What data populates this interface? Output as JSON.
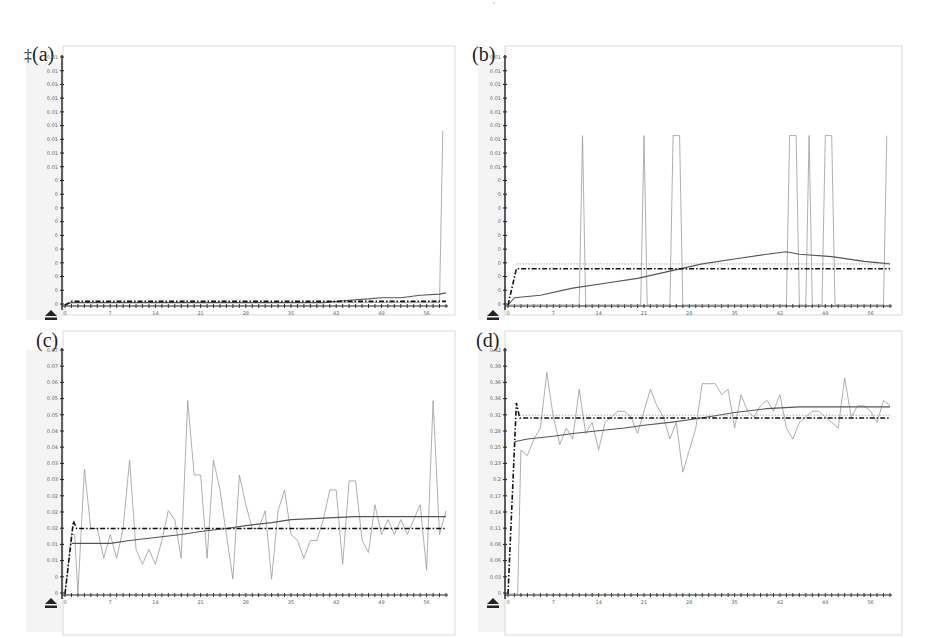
{
  "figure": {
    "top_mark": "'",
    "panels": [
      {
        "id": "a",
        "label": "(a)",
        "prefix_glyph": "‡"
      },
      {
        "id": "b",
        "label": "(b)"
      },
      {
        "id": "c",
        "label": "(c)"
      },
      {
        "id": "d",
        "label": "(d)"
      }
    ]
  },
  "chart_data": [
    {
      "panel": "(a)",
      "type": "line",
      "title": "",
      "xlabel": "",
      "ylabel": "",
      "x_ticks": [
        "0",
        "7",
        "14",
        "21",
        "28",
        "35",
        "42",
        "49",
        "56"
      ],
      "y_ticks": [
        "0",
        "0",
        "0",
        "0",
        "0",
        "0",
        "0",
        "0",
        "0",
        "0",
        "0.01",
        "0.01",
        "0.01",
        "0.01",
        "0.01",
        "0.01",
        "0.01",
        "0.01",
        "0.01"
      ],
      "xlim": [
        0,
        59
      ],
      "ylim": [
        0,
        1
      ],
      "series": [
        {
          "name": "observed",
          "style": "thin-gray",
          "x": [
            0,
            1,
            58,
            58.5
          ],
          "y": [
            0,
            0.01,
            0.01,
            0.72
          ]
        },
        {
          "name": "moving-average",
          "style": "solid-dark",
          "x": [
            0,
            1,
            40,
            44,
            47,
            49,
            52,
            55,
            58,
            59
          ],
          "y": [
            0,
            0.01,
            0.01,
            0.02,
            0.025,
            0.03,
            0.03,
            0.04,
            0.045,
            0.05
          ]
        },
        {
          "name": "baseline",
          "style": "dash-dot-bold",
          "x": [
            0,
            1,
            59
          ],
          "y": [
            0,
            0.015,
            0.015
          ]
        }
      ]
    },
    {
      "panel": "(b)",
      "type": "line",
      "title": "",
      "xlabel": "",
      "ylabel": "",
      "x_ticks": [
        "0",
        "7",
        "14",
        "21",
        "28",
        "35",
        "42",
        "49",
        "56"
      ],
      "y_ticks": [
        "0",
        "0",
        "0",
        "0",
        "0",
        "0",
        "0",
        "0",
        "0",
        "0",
        "0.01",
        "0.01",
        "0.01",
        "0.01",
        "0.01",
        "0.01",
        "0.01",
        "0.01",
        "0.01"
      ],
      "xlim": [
        0,
        59
      ],
      "ylim": [
        0,
        1
      ],
      "series": [
        {
          "name": "observed",
          "style": "thin-gray",
          "x": [
            0,
            1,
            11,
            11.5,
            12,
            20.5,
            21,
            21.5,
            25,
            25.5,
            26.5,
            27,
            43,
            43.5,
            44.5,
            45,
            46,
            46.5,
            47,
            48.5,
            49,
            50,
            50.5,
            58,
            58.5
          ],
          "y": [
            0,
            0,
            0,
            0.7,
            0,
            0,
            0.7,
            0,
            0,
            0.7,
            0.7,
            0,
            0,
            0.7,
            0.7,
            0,
            0,
            0.7,
            0,
            0,
            0.7,
            0.7,
            0,
            0,
            0.7
          ]
        },
        {
          "name": "moving-average",
          "style": "solid-dark",
          "x": [
            0,
            1,
            5,
            10,
            15,
            20,
            25,
            30,
            35,
            40,
            43,
            45,
            50,
            55,
            59
          ],
          "y": [
            0,
            0.03,
            0.04,
            0.07,
            0.09,
            0.11,
            0.14,
            0.17,
            0.19,
            0.21,
            0.22,
            0.21,
            0.2,
            0.18,
            0.17
          ]
        },
        {
          "name": "baseline",
          "style": "dash-dot-bold",
          "x": [
            0,
            1.3,
            59
          ],
          "y": [
            0,
            0.15,
            0.15
          ]
        },
        {
          "name": "upper-reference",
          "style": "dotted-gray",
          "x": [
            1.3,
            59
          ],
          "y": [
            0.17,
            0.17
          ]
        }
      ]
    },
    {
      "panel": "(c)",
      "type": "line",
      "title": "",
      "xlabel": "",
      "ylabel": "",
      "x_ticks": [
        "0",
        "7",
        "14",
        "21",
        "28",
        "35",
        "42",
        "49",
        "56"
      ],
      "y_ticks": [
        "0",
        "0",
        "0.01",
        "0.01",
        "0.02",
        "0.02",
        "0.02",
        "0.03",
        "0.03",
        "0.04",
        "0.04",
        "0.05",
        "0.05",
        "0.06",
        "0.07",
        "0.07"
      ],
      "xlim": [
        0,
        59
      ],
      "ylim": [
        0,
        0.08
      ],
      "series": [
        {
          "name": "observed",
          "style": "thin-gray",
          "x": [
            0,
            1,
            1.5,
            2,
            3,
            4,
            5,
            6,
            7,
            8,
            9,
            10,
            11,
            12,
            13,
            14,
            15,
            16,
            17,
            18,
            19,
            20,
            21,
            22,
            23,
            24,
            25,
            26,
            27,
            28,
            29,
            30,
            31,
            32,
            33,
            34,
            35,
            36,
            37,
            38,
            39,
            40,
            41,
            42,
            43,
            44,
            45,
            46,
            47,
            48,
            49,
            50,
            51,
            52,
            53,
            54,
            55,
            56,
            57,
            58,
            59
          ],
          "y": [
            0,
            0.02,
            0.02,
            0,
            0.042,
            0.022,
            0.022,
            0.012,
            0.02,
            0.012,
            0.022,
            0.045,
            0.015,
            0.01,
            0.015,
            0.01,
            0.018,
            0.028,
            0.025,
            0.012,
            0.065,
            0.04,
            0.04,
            0.012,
            0.045,
            0.035,
            0.02,
            0.005,
            0.04,
            0.03,
            0.022,
            0.022,
            0.028,
            0.005,
            0.028,
            0.035,
            0.02,
            0.018,
            0.012,
            0.018,
            0.018,
            0.025,
            0.035,
            0.035,
            0.01,
            0.038,
            0.038,
            0.018,
            0.014,
            0.03,
            0.02,
            0.025,
            0.02,
            0.025,
            0.02,
            0.025,
            0.03,
            0.008,
            0.065,
            0.02,
            0.028
          ]
        },
        {
          "name": "moving-average",
          "style": "solid-dark",
          "x": [
            1,
            3,
            7,
            10,
            14,
            18,
            21,
            25,
            28,
            32,
            35,
            40,
            45,
            50,
            55,
            59
          ],
          "y": [
            0.017,
            0.017,
            0.017,
            0.018,
            0.019,
            0.02,
            0.021,
            0.022,
            0.023,
            0.024,
            0.025,
            0.0255,
            0.026,
            0.026,
            0.026,
            0.026
          ]
        },
        {
          "name": "baseline",
          "style": "dash-dot-bold",
          "x": [
            0,
            1.3,
            1.8,
            59
          ],
          "y": [
            0,
            0.0245,
            0.022,
            0.022
          ]
        }
      ]
    },
    {
      "panel": "(d)",
      "type": "line",
      "title": "",
      "xlabel": "",
      "ylabel": "",
      "x_ticks": [
        "0",
        "7",
        "14",
        "21",
        "28",
        "35",
        "42",
        "49",
        "56"
      ],
      "y_ticks": [
        "0",
        "0.03",
        "0.06",
        "0.08",
        "0.11",
        "0.14",
        "0.17",
        "0.2",
        "0.23",
        "0.25",
        "0.28",
        "0.31",
        "0.34",
        "0.36",
        "0.39",
        "0.42"
      ],
      "xlim": [
        0,
        59
      ],
      "ylim": [
        0,
        0.43
      ],
      "series": [
        {
          "name": "observed",
          "style": "thin-gray",
          "x": [
            0,
            1.5,
            2,
            3,
            4,
            5,
            6,
            7,
            8,
            9,
            10,
            11,
            12,
            13,
            14,
            15,
            16,
            17,
            18,
            19,
            20,
            21,
            22,
            23,
            24,
            25,
            26,
            27,
            28,
            29,
            30,
            31,
            32,
            33,
            34,
            35,
            36,
            37,
            38,
            39,
            40,
            41,
            42,
            43,
            44,
            45,
            46,
            47,
            48,
            49,
            50,
            51,
            52,
            53,
            54,
            55,
            56,
            57,
            58,
            59
          ],
          "y": [
            0,
            0,
            0.26,
            0.25,
            0.28,
            0.3,
            0.4,
            0.32,
            0.27,
            0.3,
            0.28,
            0.37,
            0.29,
            0.31,
            0.26,
            0.31,
            0.32,
            0.33,
            0.33,
            0.32,
            0.29,
            0.33,
            0.37,
            0.34,
            0.32,
            0.28,
            0.31,
            0.22,
            0.26,
            0.3,
            0.38,
            0.38,
            0.38,
            0.36,
            0.37,
            0.3,
            0.36,
            0.33,
            0.32,
            0.34,
            0.35,
            0.33,
            0.36,
            0.3,
            0.28,
            0.31,
            0.32,
            0.33,
            0.33,
            0.32,
            0.31,
            0.3,
            0.39,
            0.32,
            0.34,
            0.34,
            0.33,
            0.31,
            0.35,
            0.34
          ]
        },
        {
          "name": "moving-average",
          "style": "solid-dark",
          "x": [
            1,
            3,
            7,
            10,
            14,
            18,
            21,
            25,
            28,
            32,
            35,
            40,
            45,
            50,
            55,
            59
          ],
          "y": [
            0.275,
            0.28,
            0.285,
            0.29,
            0.295,
            0.3,
            0.305,
            0.31,
            0.315,
            0.322,
            0.328,
            0.335,
            0.338,
            0.338,
            0.338,
            0.338
          ]
        },
        {
          "name": "baseline",
          "style": "dash-dot-bold",
          "x": [
            0,
            1.3,
            1.8,
            59
          ],
          "y": [
            0,
            0.345,
            0.318,
            0.318
          ]
        },
        {
          "name": "upper-reference",
          "style": "dotted-gray",
          "x": [
            1.8,
            59
          ],
          "y": [
            0.323,
            0.323
          ]
        }
      ]
    }
  ]
}
